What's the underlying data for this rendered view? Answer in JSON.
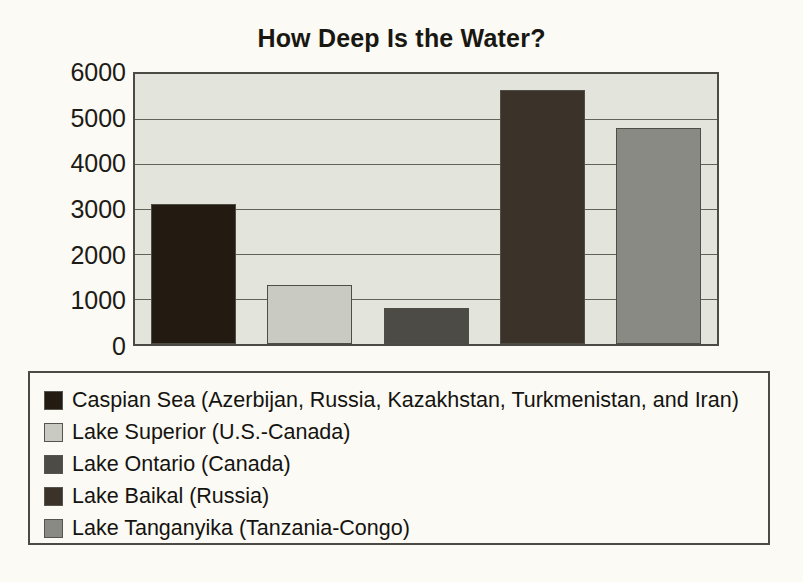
{
  "chart_data": {
    "type": "bar",
    "title": "How Deep Is the Water?",
    "xlabel": "",
    "ylabel": "",
    "ylim": [
      0,
      6000
    ],
    "ytick_labels": [
      "6000",
      "5000",
      "4000",
      "3000",
      "2000",
      "1000",
      "0"
    ],
    "ytick_values": [
      6000,
      5000,
      4000,
      3000,
      2000,
      1000,
      0
    ],
    "grid": true,
    "legend_position": "bottom",
    "categories": [
      "Caspian Sea (Azerbijan, Russia, Kazakhstan, Turkmenistan, and Iran)",
      "Lake Superior (U.S.-Canada)",
      "Lake Ontario (Canada)",
      "Lake Baikal (Russia)",
      "Lake Tanganyika (Tanzania-Congo)"
    ],
    "values": [
      3100,
      1300,
      800,
      5650,
      4800
    ],
    "colors": [
      "#231a12",
      "#c9cac2",
      "#4c4b46",
      "#3b322a",
      "#898a83"
    ]
  },
  "legend": {
    "items": [
      {
        "label": "Caspian Sea (Azerbijan, Russia, Kazakhstan, Turkmenistan, and Iran)",
        "color": "#231a12"
      },
      {
        "label": "Lake Superior (U.S.-Canada)",
        "color": "#c9cac2"
      },
      {
        "label": "Lake Ontario (Canada)",
        "color": "#4c4b46"
      },
      {
        "label": "Lake Baikal (Russia)",
        "color": "#3b322a"
      },
      {
        "label": "Lake Tanganyika (Tanzania-Congo)",
        "color": "#898a83"
      }
    ]
  },
  "plot": {
    "background_color": "#e3e4dc",
    "border_color": "#4b4a44",
    "gridline_color": "#63625a"
  },
  "page": {
    "background_color": "#fbfaf4"
  }
}
